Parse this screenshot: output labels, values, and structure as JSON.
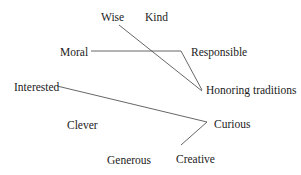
{
  "diagram": {
    "line_color": "#555555",
    "labels": {
      "wise": "Wise",
      "kind": "Kind",
      "moral": "Moral",
      "responsible": "Responsible",
      "interested": "Interested",
      "honoring_traditions": "Honoring traditions",
      "clever": "Clever",
      "curious": "Curious",
      "generous": "Generous",
      "creative": "Creative"
    },
    "connections": [
      {
        "from": "Wise",
        "to": "Honoring traditions"
      },
      {
        "from": "Moral",
        "via": "Responsible",
        "to": "Honoring traditions"
      },
      {
        "from": "Interested",
        "via": "Curious",
        "to": "Creative"
      }
    ]
  }
}
